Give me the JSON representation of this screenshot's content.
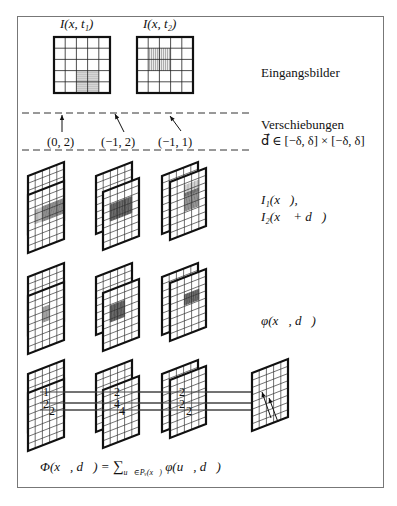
{
  "frame": {
    "border_color": "#777777"
  },
  "input_images": {
    "label": "Eingangsbilder",
    "titles": [
      "I(x, t₁)",
      "I(x, t₂)"
    ],
    "grid_size": 5,
    "grids": [
      {
        "x": 54,
        "y": 37,
        "size": 56,
        "hatch": {
          "col": 2,
          "row": 3,
          "cols": 2,
          "rows": 2,
          "dir": "h"
        }
      },
      {
        "x": 137,
        "y": 37,
        "size": 56,
        "hatch": {
          "col": 1,
          "row": 1,
          "cols": 2,
          "rows": 2,
          "dir": "v"
        }
      }
    ]
  },
  "shifts": {
    "label_line1": "Verschiebungen",
    "label_line2": "d⃗ ∈ [−δ, δ] × [−δ, δ]",
    "vectors": [
      "(0, 2)",
      "(−1, 2)",
      "(−1, 1)"
    ],
    "dash_lines_y": [
      113,
      150
    ]
  },
  "stacked_images": {
    "label_line1": "I₁(x⃗),",
    "label_line2": "I₂(x⃗ + d⃗)"
  },
  "products": {
    "label": "φ(x⃗, d⃗)"
  },
  "sums": {
    "numbers": [
      [
        "1",
        "2",
        "2"
      ],
      [
        "2",
        "4",
        "4"
      ],
      [
        "2",
        "2",
        "2"
      ]
    ]
  },
  "formula": {
    "lhs": "Φ(x⃗, d⃗) = ",
    "sum": "∑",
    "subscript": "u⃗∈Pᵥ(x⃗)",
    "rhs": " φ(u⃗, d⃗)"
  }
}
